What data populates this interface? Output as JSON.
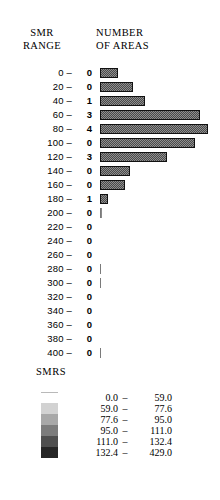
{
  "header": {
    "left_line1": "SMR",
    "left_line2": "RANGE",
    "right_line1": "NUMBER",
    "right_line2": "OF AREAS"
  },
  "chart_data": {
    "type": "bar",
    "orientation": "horizontal",
    "title": "NUMBER OF AREAS",
    "xlabel": "NUMBER OF AREAS",
    "ylabel": "SMR RANGE",
    "grid": false,
    "categories": [
      "0 –",
      "20 –",
      "40 –",
      "60 –",
      "80 –",
      "100 –",
      "120 –",
      "140 –",
      "160 –",
      "180 –",
      "200 –",
      "220 –",
      "240 –",
      "260 –",
      "280 –",
      "300 –",
      "320 –",
      "340 –",
      "360 –",
      "380 –",
      "400 –"
    ],
    "bar_lengths": [
      18,
      33,
      45,
      100,
      108,
      95,
      67,
      30,
      25,
      8,
      2,
      0,
      0,
      0,
      1,
      1,
      0,
      0,
      0,
      0,
      1
    ],
    "values": [
      0,
      0,
      1,
      3,
      4,
      0,
      3,
      0,
      0,
      1,
      0,
      0,
      0,
      0,
      0,
      0,
      0,
      0,
      0,
      0,
      0
    ],
    "rows": [
      {
        "label": "0 –",
        "count": "0",
        "bar": 18,
        "style": "bar"
      },
      {
        "label": "20 –",
        "count": "0",
        "bar": 33,
        "style": "bar"
      },
      {
        "label": "40 –",
        "count": "1",
        "bar": 45,
        "style": "bar"
      },
      {
        "label": "60 –",
        "count": "3",
        "bar": 100,
        "style": "bar"
      },
      {
        "label": "80 –",
        "count": "4",
        "bar": 108,
        "style": "bar"
      },
      {
        "label": "100 –",
        "count": "0",
        "bar": 95,
        "style": "bar"
      },
      {
        "label": "120 –",
        "count": "3",
        "bar": 67,
        "style": "bar"
      },
      {
        "label": "140 –",
        "count": "0",
        "bar": 30,
        "style": "bar"
      },
      {
        "label": "160 –",
        "count": "0",
        "bar": 25,
        "style": "bar"
      },
      {
        "label": "180 –",
        "count": "1",
        "bar": 8,
        "style": "bar"
      },
      {
        "label": "200 –",
        "count": "0",
        "bar": 2,
        "style": "tick"
      },
      {
        "label": "220 –",
        "count": "0",
        "bar": 0,
        "style": "zero"
      },
      {
        "label": "240 –",
        "count": "0",
        "bar": 0,
        "style": "zero"
      },
      {
        "label": "260 –",
        "count": "0",
        "bar": 0,
        "style": "zero"
      },
      {
        "label": "280 –",
        "count": "0",
        "bar": 1,
        "style": "tick"
      },
      {
        "label": "300 –",
        "count": "0",
        "bar": 1,
        "style": "tick"
      },
      {
        "label": "320 –",
        "count": "0",
        "bar": 0,
        "style": "zero"
      },
      {
        "label": "340 –",
        "count": "0",
        "bar": 0,
        "style": "zero"
      },
      {
        "label": "360 –",
        "count": "0",
        "bar": 0,
        "style": "zero"
      },
      {
        "label": "380 –",
        "count": "0",
        "bar": 0,
        "style": "zero"
      },
      {
        "label": "400 –",
        "count": "0",
        "bar": 1,
        "style": "tick"
      }
    ]
  },
  "legend": {
    "title": "SMRS",
    "entries": [
      {
        "low": "0.0",
        "dash": "–",
        "high": "59.0",
        "color": "#ffffff"
      },
      {
        "low": "59.0",
        "dash": "–",
        "high": "77.6",
        "color": "#d2d2d2"
      },
      {
        "low": "77.6",
        "dash": "–",
        "high": "95.0",
        "color": "#a8a8a8"
      },
      {
        "low": "95.0",
        "dash": "–",
        "high": "111.0",
        "color": "#7c7c7c"
      },
      {
        "low": "111.0",
        "dash": "–",
        "high": "132.4",
        "color": "#4f4f4f"
      },
      {
        "low": "132.4",
        "dash": "–",
        "high": "429.0",
        "color": "#262626"
      }
    ]
  }
}
